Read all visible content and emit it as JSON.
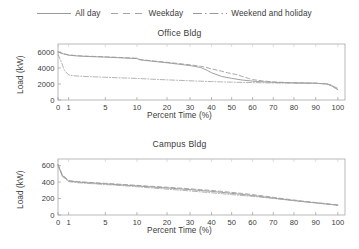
{
  "legend": {
    "position": "top-center",
    "entries": [
      {
        "label": "All day",
        "style": "solid",
        "icon": "line-swatch-solid",
        "color": "#8a8a8a"
      },
      {
        "label": "Weekday",
        "style": "dashed",
        "icon": "line-swatch-dashed",
        "color": "#9a9a9a"
      },
      {
        "label": "Weekend and holiday",
        "style": "dashdot",
        "icon": "line-swatch-dashdot",
        "color": "#8a8a8a"
      }
    ]
  },
  "chart_data": [
    {
      "type": "line",
      "title": "Office Bldg",
      "xlabel": "Percent Time (%)",
      "ylabel": "Load (kW)",
      "xscale": "probability",
      "xlim": [
        0,
        100
      ],
      "ylim": [
        0,
        7000
      ],
      "xticks": [
        0,
        1,
        5,
        10,
        20,
        30,
        40,
        50,
        60,
        70,
        80,
        90,
        100
      ],
      "xticklabels": [
        "0",
        "1",
        "5",
        "10",
        "20",
        "30",
        "40",
        "50",
        "60",
        "70",
        "80",
        "90",
        "100"
      ],
      "yticks": [
        0,
        2000,
        4000,
        6000
      ],
      "yticklabels": [
        "0",
        "2000",
        "4000",
        "6000"
      ],
      "grid": false,
      "legend_position": "figure-top",
      "series": [
        {
          "name": "All day",
          "style": "solid",
          "color": "#8f8f8f",
          "x": [
            0,
            0.5,
            1,
            2,
            3,
            5,
            7,
            10,
            11,
            15,
            20,
            25,
            30,
            35,
            38,
            40,
            45,
            50,
            55,
            60,
            65,
            70,
            75,
            80,
            85,
            90,
            95,
            97,
            99,
            100
          ],
          "y": [
            6000,
            5780,
            5600,
            5500,
            5440,
            5360,
            5290,
            5180,
            5020,
            4850,
            4650,
            4480,
            4300,
            4060,
            3700,
            3400,
            2950,
            2700,
            2500,
            2360,
            2270,
            2210,
            2170,
            2140,
            2120,
            2100,
            2000,
            1800,
            1450,
            1300
          ]
        },
        {
          "name": "Weekday",
          "style": "dashed",
          "color": "#9a9a9a",
          "x": [
            0,
            0.5,
            1,
            2,
            3,
            5,
            7,
            10,
            11,
            15,
            20,
            25,
            30,
            35,
            40,
            45,
            48,
            52,
            55,
            58,
            60,
            65,
            70,
            75,
            80,
            85,
            90,
            95,
            98,
            100
          ],
          "y": [
            6000,
            5800,
            5640,
            5540,
            5480,
            5400,
            5330,
            5220,
            5060,
            4900,
            4720,
            4560,
            4400,
            4220,
            3900,
            3600,
            3400,
            3200,
            2950,
            2700,
            2550,
            2380,
            2270,
            2200,
            2160,
            2130,
            2100,
            2010,
            1700,
            1450
          ]
        },
        {
          "name": "Weekend and holiday",
          "style": "dashdot",
          "color": "#a5a5a5",
          "x": [
            0,
            0.3,
            0.6,
            1,
            1.5,
            2,
            3,
            5,
            7,
            10,
            15,
            20,
            25,
            30,
            35,
            40,
            45,
            50,
            55,
            60,
            65,
            70,
            75,
            80,
            85,
            90,
            95,
            97,
            99,
            100
          ],
          "y": [
            5700,
            4800,
            3700,
            3130,
            3040,
            2990,
            2930,
            2840,
            2780,
            2700,
            2600,
            2520,
            2460,
            2400,
            2350,
            2300,
            2260,
            2230,
            2200,
            2170,
            2150,
            2130,
            2110,
            2100,
            2090,
            2080,
            2020,
            1900,
            1500,
            1300
          ]
        }
      ]
    },
    {
      "type": "line",
      "title": "Campus Bldg",
      "xlabel": "Percent Time (%)",
      "ylabel": "Load (kW)",
      "xscale": "probability",
      "xlim": [
        0,
        100
      ],
      "ylim": [
        0,
        680
      ],
      "xticks": [
        0,
        1,
        5,
        10,
        20,
        30,
        40,
        50,
        60,
        70,
        80,
        90,
        100
      ],
      "xticklabels": [
        "0",
        "1",
        "5",
        "10",
        "20",
        "30",
        "40",
        "50",
        "60",
        "70",
        "80",
        "90",
        "100"
      ],
      "yticks": [
        0,
        200,
        400,
        600
      ],
      "yticklabels": [
        "0",
        "200",
        "400",
        "600"
      ],
      "grid": false,
      "legend_position": "figure-top",
      "series": [
        {
          "name": "All day",
          "style": "solid",
          "color": "#8f8f8f",
          "x": [
            0,
            0.4,
            1,
            2,
            3,
            5,
            7,
            10,
            12,
            15,
            20,
            25,
            30,
            35,
            40,
            45,
            50,
            55,
            60,
            65,
            70,
            75,
            80,
            85,
            90,
            95,
            98,
            100
          ],
          "y": [
            610,
            480,
            412,
            400,
            392,
            378,
            368,
            353,
            347,
            340,
            328,
            318,
            308,
            297,
            287,
            275,
            263,
            250,
            236,
            221,
            205,
            190,
            175,
            160,
            147,
            133,
            125,
            120
          ]
        },
        {
          "name": "Weekday",
          "style": "dashed",
          "color": "#9a9a9a",
          "x": [
            0,
            0.4,
            1,
            2,
            3,
            5,
            7,
            10,
            12,
            15,
            20,
            25,
            30,
            35,
            40,
            45,
            50,
            55,
            60,
            65,
            70,
            75,
            80,
            85,
            90,
            95,
            98,
            100
          ],
          "y": [
            615,
            490,
            418,
            406,
            398,
            385,
            375,
            360,
            355,
            348,
            337,
            328,
            318,
            308,
            298,
            287,
            275,
            262,
            248,
            232,
            215,
            198,
            182,
            166,
            152,
            137,
            128,
            122
          ]
        },
        {
          "name": "Weekend and holiday",
          "style": "dashdot",
          "color": "#a5a5a5",
          "x": [
            0,
            0.4,
            1,
            2,
            3,
            5,
            7,
            10,
            12,
            15,
            20,
            25,
            30,
            35,
            40,
            45,
            50,
            55,
            60,
            65,
            70,
            75,
            80,
            85,
            90,
            95,
            98,
            100
          ],
          "y": [
            600,
            470,
            405,
            392,
            384,
            370,
            360,
            344,
            337,
            328,
            314,
            303,
            292,
            281,
            270,
            259,
            248,
            237,
            226,
            214,
            201,
            188,
            174,
            160,
            146,
            132,
            124,
            118
          ]
        }
      ]
    }
  ]
}
